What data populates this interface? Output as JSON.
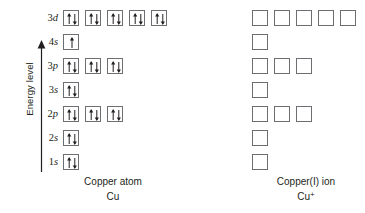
{
  "axis": {
    "label": "Energy level",
    "direction": "up",
    "icon": "up-arrow-icon"
  },
  "diagrams": [
    {
      "id": "copper-atom",
      "caption_title": "Copper atom",
      "caption_formula": "Cu",
      "caption_formula_charge": "",
      "rows": [
        {
          "n": "3",
          "subshell": "d",
          "label": "3d",
          "boxes": [
            "pair",
            "pair",
            "pair",
            "pair",
            "pair"
          ]
        },
        {
          "n": "4",
          "subshell": "s",
          "label": "4s",
          "boxes": [
            "single-up"
          ]
        },
        {
          "n": "3",
          "subshell": "p",
          "label": "3p",
          "boxes": [
            "pair",
            "pair",
            "pair"
          ]
        },
        {
          "n": "3",
          "subshell": "s",
          "label": "3s",
          "boxes": [
            "pair"
          ]
        },
        {
          "n": "2",
          "subshell": "p",
          "label": "2p",
          "boxes": [
            "pair",
            "pair",
            "pair"
          ]
        },
        {
          "n": "2",
          "subshell": "s",
          "label": "2s",
          "boxes": [
            "pair"
          ]
        },
        {
          "n": "1",
          "subshell": "s",
          "label": "1s",
          "boxes": [
            "pair"
          ]
        }
      ]
    },
    {
      "id": "copper-one-ion",
      "caption_title": "Copper(I) ion",
      "caption_formula": "Cu",
      "caption_formula_charge": "+",
      "rows": [
        {
          "n": "3",
          "subshell": "d",
          "label": "3d",
          "boxes": [
            "empty",
            "empty",
            "empty",
            "empty",
            "empty"
          ]
        },
        {
          "n": "4",
          "subshell": "s",
          "label": "4s",
          "boxes": [
            "empty"
          ]
        },
        {
          "n": "3",
          "subshell": "p",
          "label": "3p",
          "boxes": [
            "empty",
            "empty",
            "empty"
          ]
        },
        {
          "n": "3",
          "subshell": "s",
          "label": "3s",
          "boxes": [
            "empty"
          ]
        },
        {
          "n": "2",
          "subshell": "p",
          "label": "2p",
          "boxes": [
            "empty",
            "empty",
            "empty"
          ]
        },
        {
          "n": "2",
          "subshell": "s",
          "label": "2s",
          "boxes": [
            "empty"
          ]
        },
        {
          "n": "1",
          "subshell": "s",
          "label": "1s",
          "boxes": [
            "empty"
          ]
        }
      ]
    }
  ],
  "colors": {
    "box_border": "#6d6e71",
    "ink": "#231f20",
    "background": "#ffffff"
  },
  "layout": {
    "row_tops": [
      7,
      31,
      55,
      79,
      103,
      127,
      151
    ]
  }
}
